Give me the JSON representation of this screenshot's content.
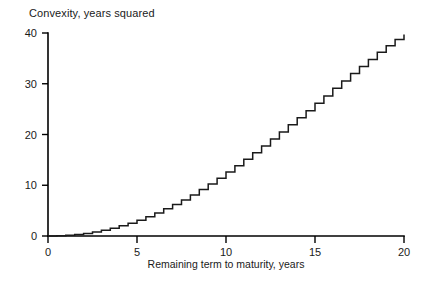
{
  "chart_data": {
    "type": "line",
    "subtype": "step",
    "title": "Convexity, years squared",
    "xlabel": "Remaining term to maturity, years",
    "ylabel": "Convexity, years squared",
    "ylabel_position": "above-axis",
    "xlim": [
      0,
      20
    ],
    "ylim": [
      0,
      40
    ],
    "xticks": [
      0,
      5,
      10,
      15,
      20
    ],
    "xtick_labels": [
      "0",
      "5",
      "10",
      "15",
      "20"
    ],
    "yticks": [
      0,
      10,
      20,
      30,
      40
    ],
    "ytick_labels": [
      "0",
      "10",
      "20",
      "30",
      "40"
    ],
    "grid": false,
    "legend": false,
    "line_color": "#1a1a1a",
    "background_color": "#ffffff",
    "step_interval_years": 0.5,
    "series": [
      {
        "name": "Convexity",
        "x": [
          0,
          0.5,
          1,
          1.5,
          2,
          2.5,
          3,
          3.5,
          4,
          4.5,
          5,
          5.5,
          6,
          6.5,
          7,
          7.5,
          8,
          8.5,
          9,
          9.5,
          10,
          10.5,
          11,
          11.5,
          12,
          12.5,
          13,
          13.5,
          14,
          14.5,
          15,
          15.5,
          16,
          16.5,
          17,
          17.5,
          18,
          18.5,
          19,
          19.5,
          20
        ],
        "values": [
          0.0,
          0.05,
          0.15,
          0.3,
          0.5,
          0.8,
          1.15,
          1.55,
          2.0,
          2.5,
          3.1,
          3.8,
          4.55,
          5.35,
          6.2,
          7.1,
          8.1,
          9.15,
          10.25,
          11.4,
          12.6,
          13.85,
          15.1,
          16.4,
          17.75,
          19.1,
          20.5,
          21.9,
          23.3,
          24.7,
          26.15,
          27.6,
          29.1,
          30.55,
          32.0,
          33.4,
          34.8,
          36.2,
          37.5,
          38.7,
          39.7
        ]
      }
    ]
  },
  "axes": {
    "x_axis_name": "x-axis",
    "y_axis_name": "y-axis"
  }
}
